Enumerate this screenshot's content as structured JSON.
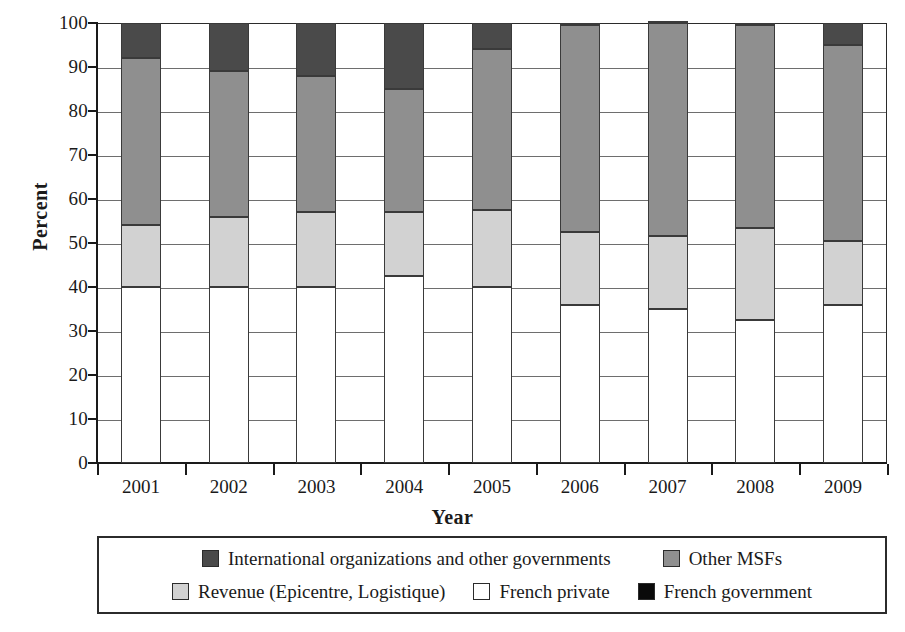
{
  "chart_data": {
    "type": "bar",
    "subtype": "stacked-bar-100-percent",
    "title": "",
    "xlabel": "Year",
    "ylabel": "Percent",
    "categories": [
      "2001",
      "2002",
      "2003",
      "2004",
      "2005",
      "2006",
      "2007",
      "2008",
      "2009"
    ],
    "ylim": [
      0,
      100
    ],
    "ytick_values": [
      0,
      10,
      20,
      30,
      40,
      50,
      60,
      70,
      80,
      90,
      100
    ],
    "ytick_labels": [
      "0",
      "10",
      "20",
      "30",
      "40",
      "50",
      "60",
      "70",
      "80",
      "90",
      "100"
    ],
    "grid": true,
    "legend_position": "bottom",
    "stack_order_bottom_to_top": [
      "French government",
      "French private",
      "Revenue (Epicentre, Logistique)",
      "Other MSFs",
      "International organizations and other governments"
    ],
    "series": [
      {
        "name": "French government",
        "color": "#0a0a0a",
        "values": [
          0,
          0,
          0,
          0,
          0,
          0,
          0,
          0,
          0
        ]
      },
      {
        "name": "French private",
        "color": "#ffffff",
        "values": [
          40,
          40,
          40,
          42.5,
          40,
          36,
          35,
          32.5,
          36
        ]
      },
      {
        "name": "Revenue (Epicentre, Logistique)",
        "color": "#d2d2d2",
        "values": [
          14,
          16,
          17,
          14.5,
          17.5,
          16.5,
          16.5,
          21,
          14.5
        ]
      },
      {
        "name": "Other MSFs",
        "color": "#8f8f8f",
        "values": [
          38,
          33,
          31,
          28,
          36.5,
          47,
          48.5,
          46,
          44.5
        ]
      },
      {
        "name": "International organizations and other governments",
        "color": "#4a4a4a",
        "values": [
          8,
          11,
          12,
          15,
          6,
          0.5,
          0.5,
          0.5,
          5
        ]
      }
    ],
    "cumulative_tops": [
      [
        40,
        54,
        92,
        100
      ],
      [
        40,
        56,
        89,
        100
      ],
      [
        40,
        57,
        88,
        100
      ],
      [
        42.5,
        57,
        85,
        100
      ],
      [
        40,
        57.5,
        94,
        100
      ],
      [
        36,
        52.5,
        99.5,
        100
      ],
      [
        35,
        51.5,
        100,
        100
      ],
      [
        32.5,
        53.5,
        99.5,
        100
      ],
      [
        36,
        50.5,
        95,
        100
      ]
    ]
  },
  "legend": {
    "rows": [
      [
        {
          "label": "International organizations and other governments",
          "color": "#4a4a4a"
        },
        {
          "label": "Other MSFs",
          "color": "#8f8f8f"
        }
      ],
      [
        {
          "label": "Revenue (Epicentre, Logistique)",
          "color": "#d2d2d2"
        },
        {
          "label": "French private",
          "color": "#ffffff"
        },
        {
          "label": "French government",
          "color": "#0a0a0a"
        }
      ]
    ]
  }
}
